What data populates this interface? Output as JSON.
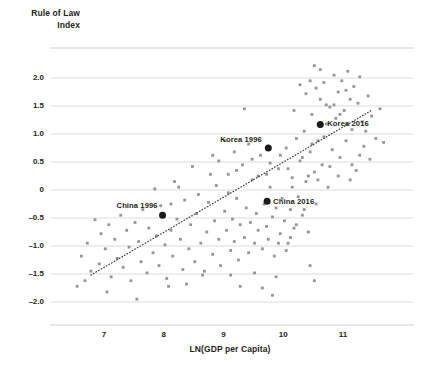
{
  "chart_data": {
    "type": "scatter",
    "title": "",
    "ylabel_lines": [
      "Rule of Law",
      "Index"
    ],
    "ylabel": "Rule of Law Index",
    "xlabel": "LN(GDP per Capita)",
    "xlim": [
      6.35,
      11.8
    ],
    "ylim": [
      -2.4,
      2.45
    ],
    "xticks": [
      7,
      8,
      9,
      10,
      11
    ],
    "xtick_labels": [
      "7",
      "8",
      "9",
      "10",
      "11"
    ],
    "yticks": [
      2.0,
      1.5,
      1.0,
      0.5,
      0,
      -0.5,
      -1.0,
      -1.5,
      -2.0
    ],
    "ytick_labels": [
      "2.0",
      "1.5",
      "1.0",
      "0.5",
      "0",
      "–0.5",
      "–1.0",
      "–1.5",
      "–2.0"
    ],
    "grid": true,
    "grid_color": "#d9d9d9",
    "legend": "none",
    "point_color": "#8c8c8c",
    "highlight_color": "#1a1a1a",
    "trendline": {
      "type": "linear-fit",
      "style": "dotted",
      "color": "#3c3c3c",
      "x_start": 6.78,
      "y_start": -1.52,
      "x_end": 11.49,
      "y_end": 1.43
    },
    "highlights": [
      {
        "label": "China 1996",
        "x": 7.98,
        "y": -0.45,
        "label_dx": -46,
        "label_dy": -9
      },
      {
        "label": "Korea 1996",
        "x": 9.75,
        "y": 0.75,
        "label_dx": -48,
        "label_dy": -8
      },
      {
        "label": "China 2016",
        "x": 9.73,
        "y": -0.2,
        "label_dx": 6,
        "label_dy": 1
      },
      {
        "label": "Korea 2016",
        "x": 10.62,
        "y": 1.17,
        "label_dx": 7,
        "label_dy": 0
      }
    ],
    "points": [
      [
        6.55,
        -1.72
      ],
      [
        6.62,
        -1.18
      ],
      [
        6.72,
        -0.95
      ],
      [
        6.78,
        -1.45
      ],
      [
        6.85,
        -0.53
      ],
      [
        6.92,
        -1.32
      ],
      [
        6.95,
        -0.78
      ],
      [
        7.02,
        -1.05
      ],
      [
        7.08,
        -0.62
      ],
      [
        7.12,
        -1.55
      ],
      [
        7.18,
        -0.88
      ],
      [
        7.22,
        -1.22
      ],
      [
        7.28,
        -0.45
      ],
      [
        7.32,
        -1.38
      ],
      [
        7.38,
        -0.72
      ],
      [
        7.42,
        -1.02
      ],
      [
        7.45,
        -1.62
      ],
      [
        7.52,
        -0.58
      ],
      [
        7.58,
        -0.92
      ],
      [
        7.62,
        -1.28
      ],
      [
        7.65,
        -0.35
      ],
      [
        7.72,
        -1.48
      ],
      [
        7.75,
        -0.68
      ],
      [
        7.82,
        -1.12
      ],
      [
        7.88,
        -0.82
      ],
      [
        7.92,
        -1.35
      ],
      [
        7.95,
        -0.28
      ],
      [
        8.02,
        -0.98
      ],
      [
        8.05,
        -1.58
      ],
      [
        8.12,
        -0.72
      ],
      [
        8.15,
        -1.18
      ],
      [
        8.22,
        -0.52
      ],
      [
        8.28,
        -0.88
      ],
      [
        8.32,
        -1.42
      ],
      [
        8.35,
        -0.18
      ],
      [
        8.42,
        -1.05
      ],
      [
        8.45,
        -0.62
      ],
      [
        8.52,
        -1.28
      ],
      [
        8.55,
        -0.42
      ],
      [
        8.62,
        -0.95
      ],
      [
        8.65,
        -1.52
      ],
      [
        8.72,
        -0.75
      ],
      [
        8.75,
        -0.22
      ],
      [
        8.82,
        -1.15
      ],
      [
        8.85,
        -0.55
      ],
      [
        8.88,
        0.08
      ],
      [
        8.92,
        -0.88
      ],
      [
        8.95,
        -1.35
      ],
      [
        9.02,
        -0.38
      ],
      [
        9.05,
        -0.72
      ],
      [
        9.08,
        0.28
      ],
      [
        9.12,
        -1.08
      ],
      [
        9.15,
        -0.52
      ],
      [
        9.18,
        -0.92
      ],
      [
        9.22,
        -0.15
      ],
      [
        9.25,
        -1.25
      ],
      [
        9.28,
        -0.62
      ],
      [
        9.32,
        0.45
      ],
      [
        9.35,
        -0.85
      ],
      [
        9.38,
        -0.32
      ],
      [
        9.42,
        -1.12
      ],
      [
        9.45,
        -0.58
      ],
      [
        9.48,
        0.18
      ],
      [
        9.52,
        -0.95
      ],
      [
        9.55,
        -0.42
      ],
      [
        9.58,
        -0.72
      ],
      [
        9.62,
        0.62
      ],
      [
        9.65,
        -1.05
      ],
      [
        9.68,
        -0.25
      ],
      [
        9.72,
        -0.65
      ],
      [
        9.75,
        -0.88
      ],
      [
        9.78,
        0.05
      ],
      [
        9.82,
        -0.48
      ],
      [
        9.85,
        -1.18
      ],
      [
        9.88,
        -0.32
      ],
      [
        9.92,
        0.38
      ],
      [
        9.95,
        -0.78
      ],
      [
        9.98,
        -0.15
      ],
      [
        10.02,
        -0.55
      ],
      [
        10.05,
        0.75
      ],
      [
        10.08,
        -0.95
      ],
      [
        10.12,
        -0.35
      ],
      [
        10.15,
        0.22
      ],
      [
        10.18,
        -0.68
      ],
      [
        10.22,
        0.92
      ],
      [
        10.25,
        -0.12
      ],
      [
        10.28,
        0.52
      ],
      [
        10.32,
        -0.45
      ],
      [
        10.35,
        1.05
      ],
      [
        10.38,
        0.15
      ],
      [
        10.42,
        -0.75
      ],
      [
        10.45,
        0.68
      ],
      [
        10.48,
        1.35
      ],
      [
        10.52,
        0.32
      ],
      [
        10.55,
        -0.25
      ],
      [
        10.58,
        0.88
      ],
      [
        10.62,
        1.62
      ],
      [
        10.65,
        0.45
      ],
      [
        10.68,
        1.92
      ],
      [
        10.72,
        1.18
      ],
      [
        10.75,
        0.05
      ],
      [
        10.78,
        1.48
      ],
      [
        10.82,
        0.72
      ],
      [
        10.85,
        2.05
      ],
      [
        10.88,
        1.28
      ],
      [
        10.92,
        1.75
      ],
      [
        10.95,
        0.58
      ],
      [
        10.98,
        1.95
      ],
      [
        11.02,
        1.42
      ],
      [
        11.05,
        0.88
      ],
      [
        11.08,
        2.12
      ],
      [
        11.12,
        1.62
      ],
      [
        11.15,
        1.08
      ],
      [
        11.18,
        1.85
      ],
      [
        11.22,
        0.35
      ],
      [
        11.25,
        1.55
      ],
      [
        11.28,
        2.02
      ],
      [
        11.32,
        1.22
      ],
      [
        11.35,
        0.78
      ],
      [
        11.42,
        1.68
      ],
      [
        11.48,
        1.32
      ],
      [
        11.55,
        0.92
      ],
      [
        11.62,
        1.45
      ],
      [
        11.68,
        0.85
      ],
      [
        8.18,
        0.15
      ],
      [
        8.48,
        0.42
      ],
      [
        8.78,
        0.28
      ],
      [
        9.08,
        -0.05
      ],
      [
        8.92,
        0.52
      ],
      [
        9.42,
        0.82
      ],
      [
        9.22,
        0.35
      ],
      [
        9.58,
        0.25
      ],
      [
        9.78,
        0.48
      ],
      [
        10.08,
        0.38
      ],
      [
        9.35,
        1.45
      ],
      [
        10.18,
        1.42
      ],
      [
        10.45,
        1.95
      ],
      [
        10.55,
        1.82
      ],
      [
        10.72,
        1.52
      ],
      [
        10.38,
        1.72
      ],
      [
        10.62,
        2.15
      ],
      [
        10.52,
        2.22
      ],
      [
        10.28,
        1.88
      ],
      [
        10.95,
        1.35
      ],
      [
        11.05,
        1.78
      ],
      [
        10.85,
        1.52
      ],
      [
        10.68,
        0.95
      ],
      [
        10.48,
        0.82
      ],
      [
        10.32,
        0.58
      ],
      [
        7.55,
        -1.95
      ],
      [
        7.05,
        -1.82
      ],
      [
        6.68,
        -1.62
      ],
      [
        8.08,
        -1.72
      ],
      [
        8.38,
        -1.68
      ],
      [
        9.52,
        -1.48
      ],
      [
        9.88,
        -1.55
      ],
      [
        9.65,
        -1.75
      ],
      [
        8.68,
        -1.45
      ],
      [
        9.12,
        -1.52
      ],
      [
        10.12,
        -0.85
      ],
      [
        10.22,
        -0.62
      ],
      [
        10.35,
        -0.35
      ],
      [
        10.05,
        -1.08
      ],
      [
        9.92,
        -0.95
      ],
      [
        11.15,
        0.45
      ],
      [
        11.28,
        0.62
      ],
      [
        10.92,
        0.25
      ],
      [
        11.38,
        1.05
      ],
      [
        11.45,
        0.55
      ],
      [
        8.25,
        0.05
      ],
      [
        8.58,
        -0.08
      ],
      [
        9.18,
        0.68
      ],
      [
        9.48,
        0.55
      ],
      [
        9.72,
        0.28
      ],
      [
        10.15,
        0.05
      ],
      [
        10.42,
        0.25
      ],
      [
        9.02,
        0.88
      ],
      [
        8.82,
        0.62
      ],
      [
        9.95,
        0.62
      ],
      [
        10.58,
        0.18
      ],
      [
        10.78,
        0.42
      ],
      [
        11.12,
        0.18
      ],
      [
        7.85,
        0.02
      ],
      [
        8.12,
        -0.25
      ],
      [
        9.28,
        -1.72
      ],
      [
        9.82,
        -1.88
      ],
      [
        10.45,
        -1.35
      ],
      [
        10.52,
        -1.62
      ]
    ]
  }
}
